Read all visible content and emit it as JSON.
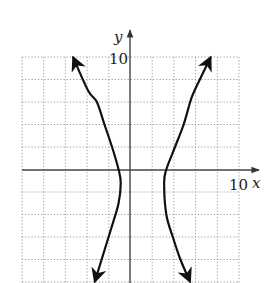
{
  "chart_data": {
    "type": "line",
    "title": "",
    "xlabel": "x",
    "ylabel": "y",
    "xlim": [
      -10,
      10
    ],
    "ylim": [
      -10,
      10
    ],
    "grid": true,
    "grid_step": 2,
    "tick_labels": {
      "x_max": "10",
      "y_max": "10"
    },
    "series": [
      {
        "name": "left-branch",
        "points": [
          [
            -5.3,
            10
          ],
          [
            -3.9,
            7
          ],
          [
            -3.1,
            6
          ],
          [
            -2.4,
            4
          ],
          [
            -1.7,
            2
          ],
          [
            -1.1,
            0
          ],
          [
            -0.9,
            -1.2
          ],
          [
            -1.1,
            -3
          ],
          [
            -1.7,
            -5
          ],
          [
            -2.5,
            -7.5
          ],
          [
            -3.3,
            -10
          ]
        ]
      },
      {
        "name": "right-branch",
        "points": [
          [
            7.4,
            10
          ],
          [
            5.9,
            7
          ],
          [
            5.5,
            6
          ],
          [
            4.9,
            4
          ],
          [
            4.1,
            2
          ],
          [
            3.3,
            0
          ],
          [
            3.1,
            -1.2
          ],
          [
            3.3,
            -4
          ],
          [
            3.9,
            -6
          ],
          [
            4.6,
            -8
          ],
          [
            5.5,
            -10
          ]
        ]
      }
    ],
    "center": [
      1,
      -1
    ],
    "arrows": "both ends of each branch"
  },
  "labels": {
    "x_axis": "x",
    "y_axis": "y",
    "x_tick": "10",
    "y_tick": "10"
  },
  "colors": {
    "curve": "#111111",
    "axis": "#444444",
    "grid": "#9a9a9a"
  }
}
